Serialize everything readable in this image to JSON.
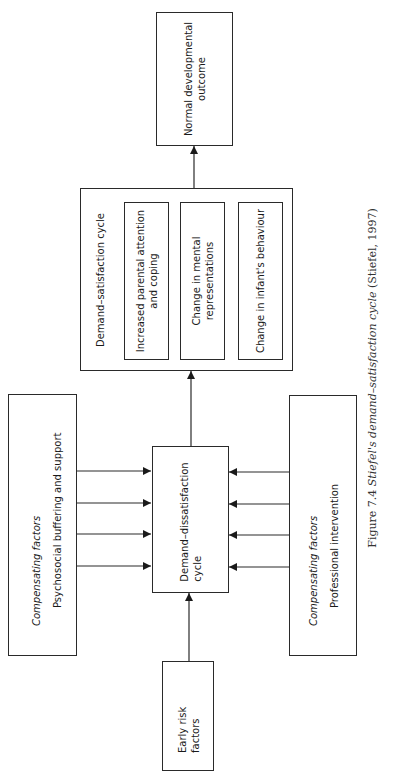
{
  "diagram": {
    "nodes": {
      "outcome": {
        "label_line1": "Normal developmental",
        "label_line2": "outcome"
      },
      "satisfaction": {
        "title": "Demand–satisfaction cycle",
        "items": [
          {
            "line1": "Increased parental attention",
            "line2": "and coping"
          },
          {
            "line1": "Change in mental",
            "line2": "representations"
          },
          {
            "line1": "Change in infant's behaviour",
            "line2": ""
          }
        ]
      },
      "dissatisfaction": {
        "label_line1": "Demand–dissatisfaction",
        "label_line2": "cycle"
      },
      "comp_left": {
        "heading": "Compensating factors",
        "label": "Psychosocial buffering and support"
      },
      "comp_right": {
        "heading": "Compensating factors",
        "label": "Professional intervention"
      },
      "risk": {
        "label_line1": "Early risk",
        "label_line2": "factors"
      }
    },
    "edges": [
      {
        "from": "risk",
        "to": "dissatisfaction"
      },
      {
        "from": "comp_left",
        "to": "dissatisfaction",
        "count": 4
      },
      {
        "from": "comp_right",
        "to": "dissatisfaction",
        "count": 4
      },
      {
        "from": "dissatisfaction",
        "to": "satisfaction"
      },
      {
        "from": "satisfaction",
        "to": "outcome"
      }
    ],
    "caption": {
      "prefix": "Figure 7.4  ",
      "italic": "Stiefel's demand–satisfaction cycle",
      "suffix": " (Stiefel, 1997)"
    },
    "colors": {
      "line": "#2a2a2a",
      "background": "#ffffff"
    }
  }
}
